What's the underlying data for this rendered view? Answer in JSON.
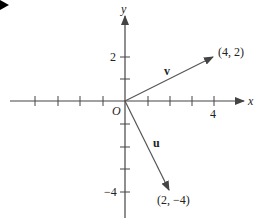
{
  "diagram": {
    "type": "vector-plane",
    "origin_label": "O",
    "x_axis_label": "x",
    "y_axis_label": "y",
    "x_tick_label": "4",
    "y_tick_labels": {
      "pos": "2",
      "neg": "−4"
    },
    "vectors": [
      {
        "name": "v",
        "end": [
          4,
          2
        ],
        "end_label": "(4, 2)"
      },
      {
        "name": "u",
        "end": [
          2,
          -4
        ],
        "end_label": "(2, −4)"
      }
    ],
    "colors": {
      "axis": "#333333",
      "vector": "#555555",
      "marker": "#000000"
    }
  }
}
